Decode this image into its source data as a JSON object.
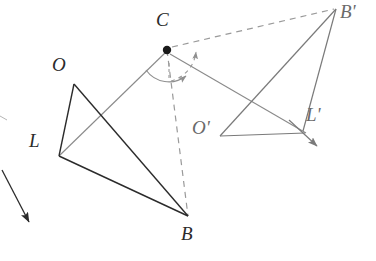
{
  "figure": {
    "background_color": "#ffffff",
    "width": 376,
    "height": 261,
    "stroke_dark": "#2b2b2b",
    "stroke_gray": "#7a7a7a",
    "stroke_dashed": "#9a9a9a"
  },
  "points": {
    "C": {
      "label": "C",
      "x": 167,
      "y": 50,
      "label_x": 156,
      "label_y": 10,
      "marker": "filled-dot",
      "color": "#2b2b2b"
    },
    "O": {
      "label": "O",
      "x": 74,
      "y": 84,
      "label_x": 52,
      "label_y": 55,
      "marker": "none",
      "color": "#2b2b2b"
    },
    "L": {
      "label": "L",
      "x": 59,
      "y": 156,
      "label_x": 29,
      "label_y": 131,
      "marker": "none",
      "color": "#2b2b2b"
    },
    "B": {
      "label": "B",
      "x": 188,
      "y": 216,
      "label_x": 181,
      "label_y": 224,
      "marker": "none",
      "color": "#2b2b2b"
    },
    "Op": {
      "label": "O'",
      "x": 220,
      "y": 136,
      "label_x": 192,
      "label_y": 118,
      "marker": "none",
      "color": "#6a6a6a"
    },
    "Lp": {
      "label": "L'",
      "x": 303,
      "y": 131,
      "label_x": 306,
      "label_y": 105,
      "marker": "none",
      "color": "#6a6a6a"
    },
    "Bp": {
      "label": "B'",
      "x": 336,
      "y": 8,
      "label_x": 340,
      "label_y": 2,
      "marker": "none",
      "color": "#6a6a6a"
    }
  },
  "segments": [
    {
      "name": "O-L",
      "from": "O",
      "to": "L",
      "style": "solid",
      "color": "#2b2b2b",
      "width": 1.4
    },
    {
      "name": "O-B",
      "from": "O",
      "to": "B",
      "style": "solid",
      "color": "#2b2b2b",
      "width": 1.4
    },
    {
      "name": "L-B",
      "from": "L",
      "to": "B",
      "style": "solid",
      "color": "#2b2b2b",
      "width": 1.4
    },
    {
      "name": "Op-Lp",
      "from": "Op",
      "to": "Lp",
      "style": "solid",
      "color": "#7a7a7a",
      "width": 1.2
    },
    {
      "name": "Op-Bp",
      "from": "Op",
      "to": "Bp",
      "style": "solid",
      "color": "#7a7a7a",
      "width": 1.2
    },
    {
      "name": "Lp-Bp",
      "from": "Lp",
      "to": "Bp",
      "style": "solid",
      "color": "#7a7a7a",
      "width": 1.2
    },
    {
      "name": "C-L",
      "from": "C",
      "to": "L",
      "style": "solid",
      "color": "#8a8a8a",
      "width": 1.1
    },
    {
      "name": "C-Lp",
      "from": "C",
      "to": "Lp",
      "style": "solid",
      "color": "#8a8a8a",
      "width": 1.1
    },
    {
      "name": "C-B",
      "from": "C",
      "to": "B",
      "style": "dashed",
      "color": "#9a9a9a",
      "width": 1.2
    },
    {
      "name": "C-Bp",
      "from": "C",
      "to": "Bp",
      "style": "dashed",
      "color": "#9a9a9a",
      "width": 1.2
    }
  ],
  "arrows": [
    {
      "name": "rotation-arc-main",
      "type": "arc",
      "note": "angle arc at C from ray C-L sweeping toward ray C-B"
    },
    {
      "name": "rotation-arc-dashed",
      "type": "arc",
      "note": "dashed arc at C sweeping up-right toward C-B'"
    },
    {
      "name": "translation-arrow-left",
      "type": "straight",
      "x1": 2,
      "y1": 170,
      "x2": 30,
      "y2": 224
    },
    {
      "name": "translation-arrow-right",
      "type": "straight",
      "x1": 288,
      "y1": 120,
      "x2": 318,
      "y2": 146
    }
  ]
}
